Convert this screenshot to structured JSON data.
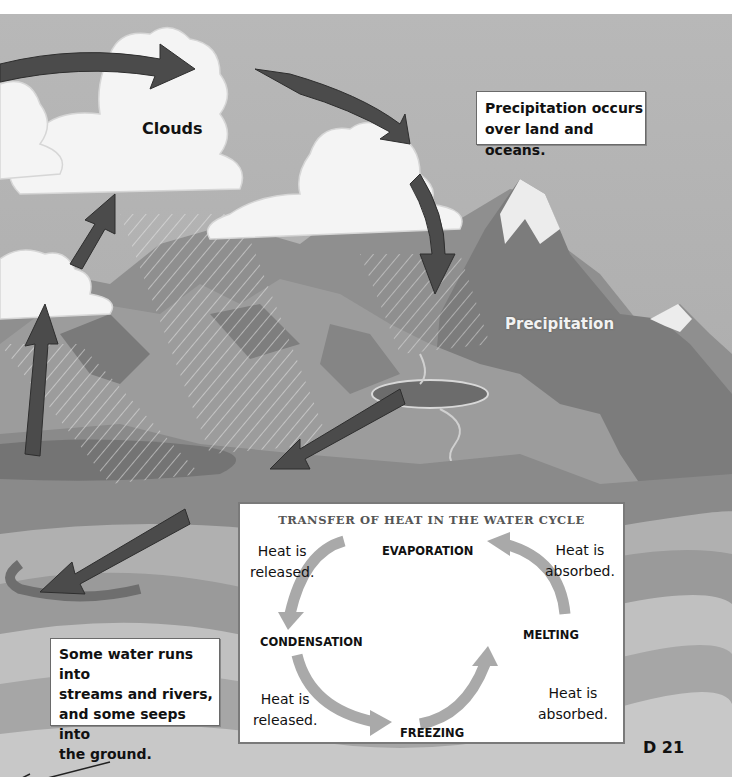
{
  "diagram": {
    "title": "Water Cycle",
    "colors": {
      "sky": "#a9a9a9",
      "cloud": "#f4f4f4",
      "mountain_dark": "#6e6e6e",
      "mountain_mid": "#8d8d8d",
      "mountain_light": "#b5b5b5",
      "snow": "#ececec",
      "water": "#7a7a7a",
      "arrow": "#4a4a4a",
      "panel_arrow": "#a8a8a8"
    },
    "labels": {
      "clouds": "Clouds",
      "precipitation": "Precipitation"
    },
    "callouts": {
      "precipitation_note": [
        "Precipitation occurs",
        "over land and oceans."
      ],
      "runoff_note": [
        "Some water runs into",
        "streams and rivers,",
        "and some seeps into",
        "the ground."
      ]
    },
    "heat_panel": {
      "title": "TRANSFER OF HEAT IN THE WATER CYCLE",
      "phases": {
        "evaporation": "EVAPORATION",
        "condensation": "CONDENSATION",
        "freezing": "FREEZING",
        "melting": "MELTING"
      },
      "notes": {
        "top_left": [
          "Heat is",
          "released."
        ],
        "top_right": [
          "Heat is",
          "absorbed."
        ],
        "bottom_left": [
          "Heat is",
          "released."
        ],
        "bottom_right": [
          "Heat is",
          "absorbed."
        ]
      }
    },
    "page_number": "D 21"
  }
}
